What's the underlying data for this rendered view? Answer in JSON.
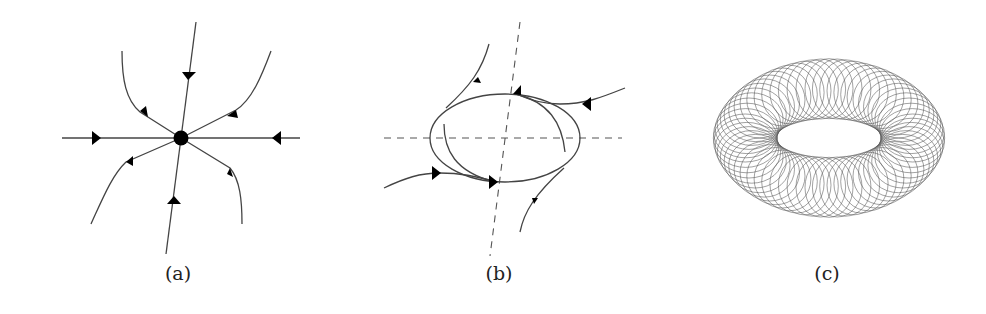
{
  "figure": {
    "panels": [
      {
        "id": "a",
        "caption": "(a)",
        "description": "Stable node: trajectories converge to an equilibrium point along straight and curved paths"
      },
      {
        "id": "b",
        "caption": "(b)",
        "description": "Limit cycle: trajectories inside and outside approach a closed elliptical orbit, with dashed axes"
      },
      {
        "id": "c",
        "caption": "(c)",
        "description": "Quasi-periodic trajectory densely winding around a torus"
      }
    ]
  }
}
